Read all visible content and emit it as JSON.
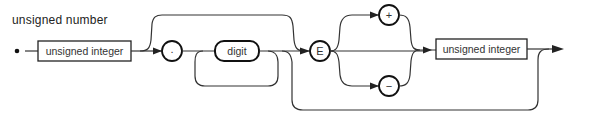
{
  "diagram": {
    "title": "unsigned number",
    "type": "syntax-diagram",
    "nodes": [
      {
        "id": "n1",
        "kind": "nonterminal",
        "label": "unsigned integer"
      },
      {
        "id": "n2",
        "kind": "terminal",
        "label": "."
      },
      {
        "id": "n3",
        "kind": "nonterminal-rounded",
        "label": "digit"
      },
      {
        "id": "n4",
        "kind": "terminal",
        "label": "E"
      },
      {
        "id": "n5",
        "kind": "terminal",
        "label": "+"
      },
      {
        "id": "n6",
        "kind": "terminal",
        "label": "−"
      },
      {
        "id": "n7",
        "kind": "nonterminal",
        "label": "unsigned integer"
      }
    ],
    "edges": [
      {
        "from": "start",
        "to": "n1"
      },
      {
        "from": "n1",
        "to": "n2"
      },
      {
        "from": "n1",
        "to": "n4",
        "note": "bypass over fraction"
      },
      {
        "from": "n2",
        "to": "n3"
      },
      {
        "from": "n3",
        "to": "n3",
        "note": "repeat loop"
      },
      {
        "from": "n3",
        "to": "n4"
      },
      {
        "from": "n3",
        "to": "end",
        "note": "bypass exponent"
      },
      {
        "from": "n4",
        "to": "n5"
      },
      {
        "from": "n4",
        "to": "n6"
      },
      {
        "from": "n4",
        "to": "n7",
        "note": "no sign"
      },
      {
        "from": "n5",
        "to": "n7"
      },
      {
        "from": "n6",
        "to": "n7"
      },
      {
        "from": "n7",
        "to": "end"
      }
    ]
  }
}
